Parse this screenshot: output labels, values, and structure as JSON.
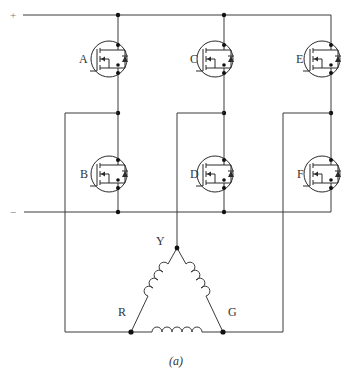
{
  "diagram": {
    "rails": {
      "positive": "+",
      "negative": "−"
    },
    "switches": [
      {
        "id": "A",
        "label": "A",
        "leg": 1,
        "position": "high"
      },
      {
        "id": "B",
        "label": "B",
        "leg": 1,
        "position": "low"
      },
      {
        "id": "C",
        "label": "C",
        "leg": 2,
        "position": "high"
      },
      {
        "id": "D",
        "label": "D",
        "leg": 2,
        "position": "low"
      },
      {
        "id": "E",
        "label": "E",
        "leg": 3,
        "position": "high"
      },
      {
        "id": "F",
        "label": "F",
        "leg": 3,
        "position": "low"
      }
    ],
    "windings": {
      "type": "delta",
      "terminals": [
        {
          "id": "Y",
          "label": "Y"
        },
        {
          "id": "R",
          "label": "R"
        },
        {
          "id": "G",
          "label": "G"
        }
      ]
    },
    "connections": [
      {
        "leg_midpoint": "A-B",
        "terminal": "R"
      },
      {
        "leg_midpoint": "C-D",
        "terminal": "Y"
      },
      {
        "leg_midpoint": "E-F",
        "terminal": "G"
      }
    ],
    "caption": "(a)",
    "colors": {
      "line": "#3a3a3a",
      "node": "#111111",
      "background": "#ffffff"
    }
  }
}
